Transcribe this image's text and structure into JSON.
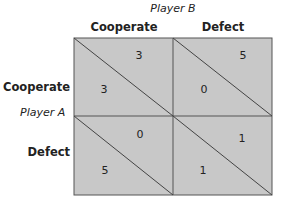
{
  "player_b": "Player B",
  "player_a": "Player A",
  "columns": [
    "Cooperate",
    "Defect"
  ],
  "rows": [
    "Cooperate",
    "Defect"
  ],
  "cells": [
    [
      {
        "b": "3",
        "a": "3"
      },
      {
        "b": "5",
        "a": "0"
      }
    ],
    [
      {
        "b": "0",
        "a": "5"
      },
      {
        "b": "1",
        "a": "1"
      }
    ]
  ],
  "colors": {
    "cell_fill": "#c8c8c8",
    "line": "#444444"
  }
}
